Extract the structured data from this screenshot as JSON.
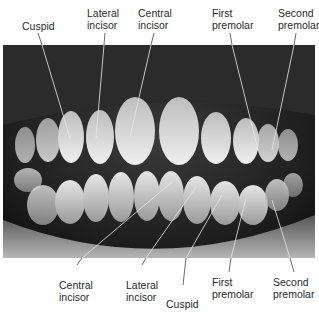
{
  "figure": {
    "upper_labels": [
      {
        "id": "upper-cuspid",
        "text": "Cuspid"
      },
      {
        "id": "upper-lateral-incisor",
        "text": "Lateral\nincisor"
      },
      {
        "id": "upper-central-incisor",
        "text": "Central\nincisor"
      },
      {
        "id": "upper-first-premolar",
        "text": "First\npremolar"
      },
      {
        "id": "upper-second-premolar",
        "text": "Second\npremolar"
      }
    ],
    "lower_labels": [
      {
        "id": "lower-central-incisor",
        "text": "Central\nincisor"
      },
      {
        "id": "lower-lateral-incisor",
        "text": "Lateral\nincisor"
      },
      {
        "id": "lower-cuspid",
        "text": "Cuspid"
      },
      {
        "id": "lower-first-premolar",
        "text": "First\npremolar"
      },
      {
        "id": "lower-second-premolar",
        "text": "Second\npremolar"
      }
    ]
  },
  "labels": {
    "upper_cuspid": "Cuspid",
    "upper_lateral_line1": "Lateral",
    "upper_lateral_line2": "incisor",
    "upper_central_line1": "Central",
    "upper_central_line2": "incisor",
    "upper_first_pre_line1": "First",
    "upper_first_pre_line2": "premolar",
    "upper_second_pre_line1": "Second",
    "upper_second_pre_line2": "premolar",
    "lower_central_line1": "Central",
    "lower_central_line2": "incisor",
    "lower_lateral_line1": "Lateral",
    "lower_lateral_line2": "incisor",
    "lower_cuspid": "Cuspid",
    "lower_first_pre_line1": "First",
    "lower_first_pre_line2": "premolar",
    "lower_second_pre_line1": "Second",
    "lower_second_pre_line2": "premolar"
  },
  "colors": {
    "background": "#ffffff",
    "label_text": "#2a2a2a",
    "leader_line": "#e8e8e8",
    "leader_line_outside": "#444444"
  }
}
